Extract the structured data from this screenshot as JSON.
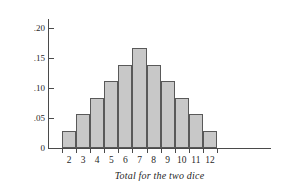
{
  "chart_data": {
    "type": "bar",
    "title": "",
    "subtitle": "",
    "xlabel": "Total for the two dice",
    "ylabel": "Probability",
    "categories": [
      "2",
      "3",
      "4",
      "5",
      "6",
      "7",
      "8",
      "9",
      "10",
      "11",
      "12"
    ],
    "values": [
      0.028,
      0.056,
      0.083,
      0.111,
      0.139,
      0.167,
      0.139,
      0.111,
      0.083,
      0.056,
      0.028
    ],
    "ylim": [
      0,
      0.215
    ],
    "ytick_values": [
      0,
      0.05,
      0.1,
      0.15,
      0.2
    ],
    "ytick_labels": [
      "0",
      ".05",
      ".10",
      ".15",
      ".20"
    ],
    "xtick_labels": [
      "2",
      "3",
      "4",
      "5",
      "6",
      "7",
      "8",
      "9",
      "10",
      "11",
      "12"
    ],
    "grid": false,
    "legend": null,
    "annotations": [],
    "colors": {
      "bar_fill": "#c8c8c8",
      "bar_edge": "#595959",
      "axis": "#4a4a4a",
      "text": "#1f1f1f",
      "background": "#ffffff"
    }
  }
}
